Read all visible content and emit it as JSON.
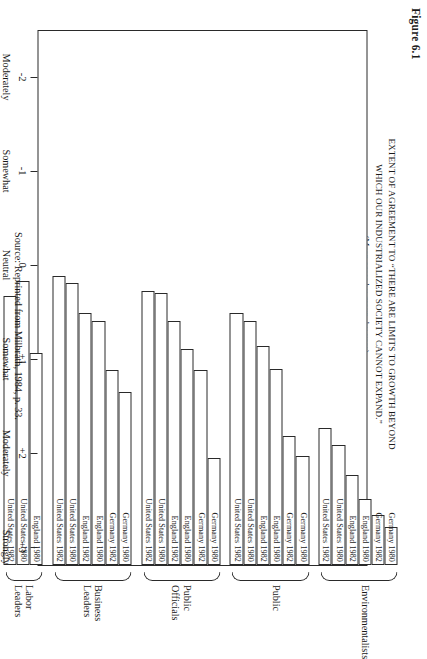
{
  "figure": {
    "number": "Figure 6.1",
    "title_line1": "EXTENT OF AGREEMENT TO “THERE ARE LIMITS TO GROWTH BEYOND",
    "title_line2": "WHICH OUR INDUSTRIALIZED SOCIETY CANNOT EXPAND.”",
    "subtitle": "(Mean score by group, by year)",
    "source": "Source: Reprinted from Milbrath, 1984, p. 33."
  },
  "axis": {
    "ticks": [
      {
        "value": 3,
        "num": "+3",
        "word1": "Strongly",
        "word2": "Agree"
      },
      {
        "value": 2,
        "num": "+2",
        "word1": "Moderately",
        "word2": "Agree"
      },
      {
        "value": 1,
        "num": "+1",
        "word1": "Somewhat",
        "word2": "Agree"
      },
      {
        "value": 0,
        "num": "0",
        "word1": "Neutral",
        "word2": ""
      },
      {
        "value": -1,
        "num": "-1",
        "word1": "Somewhat",
        "word2": "Disagree"
      },
      {
        "value": -2,
        "num": "-2",
        "word1": "Moderately",
        "word2": "Disagree"
      }
    ]
  },
  "chart_data": {
    "type": "bar",
    "orientation": "horizontal",
    "title": "EXTENT OF AGREEMENT TO “THERE ARE LIMITS TO GROWTH BEYOND WHICH OUR INDUSTRIALIZED SOCIETY CANNOT EXPAND.”",
    "subtitle": "(Mean score by group, by year)",
    "xlabel": "Mean score",
    "ylabel": "",
    "xlim": [
      -2.5,
      3.2
    ],
    "grid": false,
    "legend": "none",
    "axis_tick_labels": [
      "+3 Strongly Agree",
      "+2 Moderately Agree",
      "+1 Somewhat Agree",
      "0 Neutral",
      "-1 Somewhat Disagree",
      "-2 Moderately Disagree"
    ],
    "groups": [
      {
        "name": "Environmentalists",
        "bars": [
          {
            "label": "Germany 1980",
            "value": 2.8
          },
          {
            "label": "Germany 1982",
            "value": 2.67
          },
          {
            "label": "England 1980",
            "value": 2.5
          },
          {
            "label": "England 1982",
            "value": 2.24
          },
          {
            "label": "United States 1980",
            "value": 1.92
          },
          {
            "label": "United States 1982",
            "value": 1.74
          }
        ]
      },
      {
        "name": "Public",
        "bars": [
          {
            "label": "Germany 1980",
            "value": 2.04
          },
          {
            "label": "Germany 1982",
            "value": 1.83
          },
          {
            "label": "England 1980",
            "value": 1.12
          },
          {
            "label": "England 1982",
            "value": 0.87
          },
          {
            "label": "United States 1980",
            "value": 0.6
          },
          {
            "label": "United States 1982",
            "value": 0.52
          }
        ]
      },
      {
        "name": "Public Officials",
        "bars": [
          {
            "label": "Germany 1980",
            "value": 2.06
          },
          {
            "label": "Germany 1982",
            "value": 1.13
          },
          {
            "label": "England 1980",
            "value": 0.9
          },
          {
            "label": "England 1982",
            "value": 0.6
          },
          {
            "label": "United States 1980",
            "value": 0.31
          },
          {
            "label": "United States 1982",
            "value": 0.29
          }
        ]
      },
      {
        "name": "Business Leaders",
        "bars": [
          {
            "label": "Germany 1980",
            "value": 1.36
          },
          {
            "label": "Germany 1982",
            "value": 1.13
          },
          {
            "label": "England 1980",
            "value": 0.6
          },
          {
            "label": "England 1982",
            "value": 0.52
          },
          {
            "label": "United States 1980",
            "value": 0.2
          },
          {
            "label": "United States 1982",
            "value": 0.13
          }
        ]
      },
      {
        "name": "Labor Leaders",
        "bars": [
          {
            "label": "England 1980",
            "value": 0.95
          },
          {
            "label": "United States 1980",
            "value": 0.18
          },
          {
            "label": "United States 1982",
            "value": 0.34
          }
        ]
      }
    ]
  }
}
